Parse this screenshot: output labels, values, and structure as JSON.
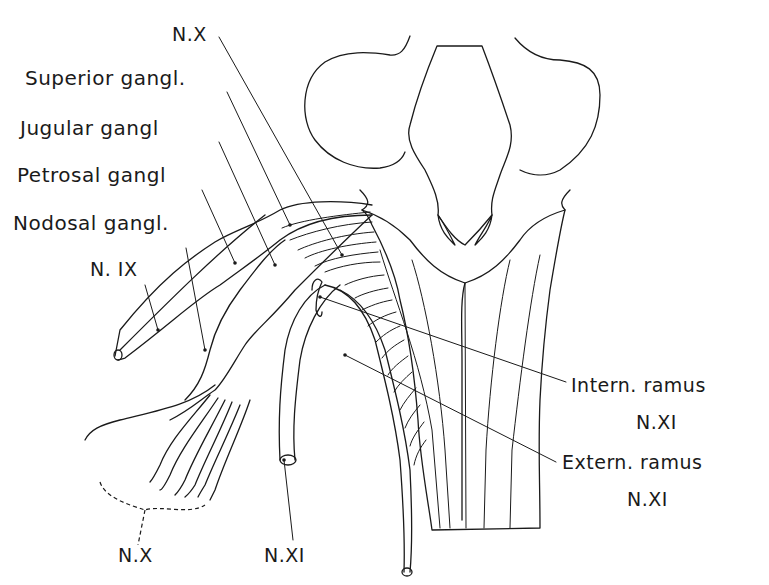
{
  "figure": {
    "labels": {
      "nx_top": "N.X",
      "superior_gangl": "Superior gangl.",
      "jugular_gangl": "Jugular gangl",
      "petrosal_gangl": "Petrosal gangl",
      "nodosal_gangl": "Nodosal gangl.",
      "n_ix": "N. IX",
      "intern_ramus": "Intern. ramus",
      "intern_ramus_nerve": "N.XI",
      "extern_ramus": "Extern. ramus",
      "extern_ramus_nerve": "N.XI",
      "nx_bottom": "N.X",
      "nxi_bottom": "N.XI"
    },
    "colors": {
      "ink": "#1a1a1a",
      "paper": "#ffffff"
    }
  }
}
